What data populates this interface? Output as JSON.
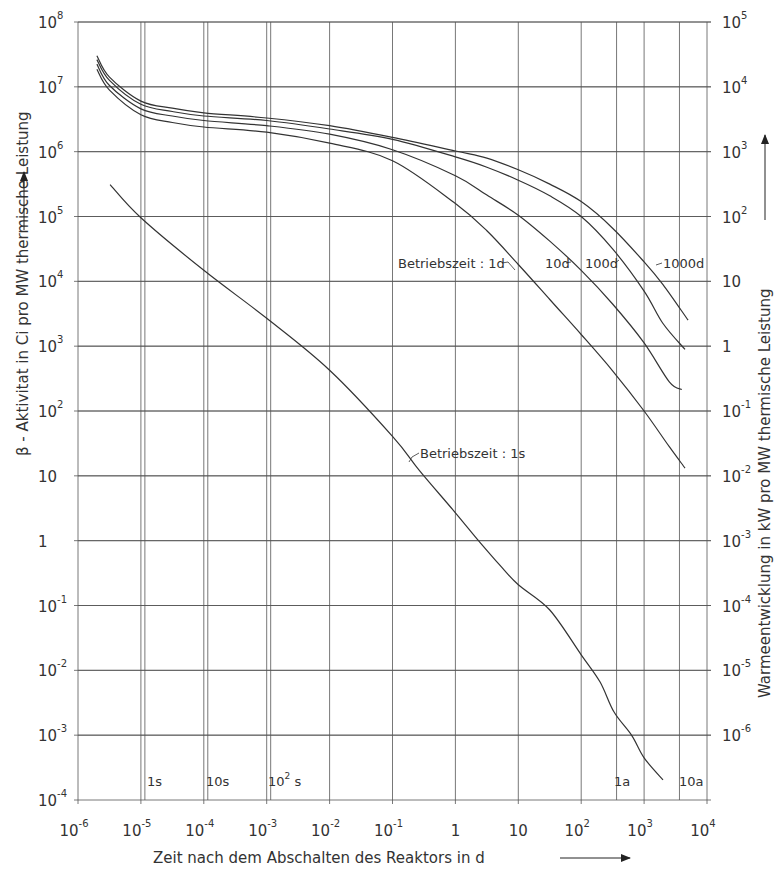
{
  "chart_data": {
    "type": "line",
    "title": "",
    "xlabel": "Zeit nach dem Abschalten des Reaktors in d",
    "ylabel": "β - Aktivitat in Ci pro MW thermische Leistung",
    "y2label": "Warmeentwicklung in kW pro MW thermische Leistung",
    "xscale": "log",
    "yscale": "log",
    "xlim": [
      1e-06,
      10000.0
    ],
    "ylim": [
      0.0001,
      100000000.0
    ],
    "y2lim": [
      1e-07,
      100000.0
    ],
    "grid": true,
    "x_tick_labels": [
      "10^-6",
      "10^-5",
      "10^-4",
      "10^-3",
      "10^-2",
      "10^-1",
      "1",
      "10",
      "10^2",
      "10^3",
      "10^4"
    ],
    "y_tick_labels": [
      "10^-4",
      "10^-3",
      "10^-2",
      "10^-1",
      "1",
      "10",
      "10^2",
      "10^3",
      "10^4",
      "10^5",
      "10^6",
      "10^7",
      "10^8"
    ],
    "y2_tick_labels": [
      "10^-6",
      "10^-5",
      "10^-4",
      "10^-3",
      "10^-2",
      "10^-1",
      "1",
      "10",
      "10^2",
      "10^3",
      "10^4",
      "10^5"
    ],
    "time_markers": [
      {
        "label": "1s",
        "t_days": 1.157e-05
      },
      {
        "label": "10s",
        "t_days": 0.0001157
      },
      {
        "label": "10^2 s",
        "t_days": 0.001157
      },
      {
        "label": "1a",
        "t_days": 365
      },
      {
        "label": "10a",
        "t_days": 3650
      }
    ],
    "series": [
      {
        "name": "Betriebszeit: 1s",
        "log_x": [
          -5.49,
          -5.0,
          -4.0,
          -3.0,
          -2.0,
          -1.0,
          -0.57,
          0.0,
          0.35,
          0.7,
          1.0,
          1.5,
          2.0,
          2.3,
          2.52,
          2.8,
          3.0,
          3.3
        ],
        "log_y": [
          5.49,
          4.98,
          4.17,
          3.43,
          2.63,
          1.61,
          1.08,
          0.43,
          0.02,
          -0.37,
          -0.68,
          -1.07,
          -1.76,
          -2.18,
          -2.64,
          -3.0,
          -3.35,
          -3.69
        ]
      },
      {
        "name": "Betriebszeit: 1d",
        "log_x": [
          -5.7,
          -5.5,
          -5.0,
          -4.5,
          -4.0,
          -3.0,
          -2.0,
          -1.0,
          0.0,
          0.5,
          1.0,
          1.5,
          2.0,
          2.5,
          3.0,
          3.4,
          3.65
        ],
        "log_y": [
          7.27,
          6.95,
          6.57,
          6.45,
          6.38,
          6.3,
          6.13,
          5.86,
          5.2,
          4.78,
          4.26,
          3.72,
          3.18,
          2.62,
          2.0,
          1.45,
          1.12
        ]
      },
      {
        "name": "Betriebszeit: 10d",
        "log_x": [
          -5.7,
          -5.5,
          -5.0,
          -4.5,
          -4.0,
          -3.0,
          -2.0,
          -1.0,
          0.0,
          0.5,
          1.0,
          1.5,
          2.0,
          2.5,
          3.0,
          3.4,
          3.6
        ],
        "log_y": [
          7.35,
          7.02,
          6.66,
          6.55,
          6.48,
          6.4,
          6.27,
          6.03,
          5.63,
          5.33,
          5.02,
          4.62,
          4.17,
          3.65,
          3.05,
          2.45,
          2.33
        ]
      },
      {
        "name": "Betriebszeit: 100d",
        "log_x": [
          -5.7,
          -5.5,
          -5.0,
          -4.5,
          -4.0,
          -3.0,
          -2.0,
          -1.0,
          0.0,
          0.5,
          1.0,
          1.5,
          2.0,
          2.5,
          3.0,
          3.3,
          3.65
        ],
        "log_y": [
          7.42,
          7.1,
          6.73,
          6.62,
          6.55,
          6.48,
          6.35,
          6.19,
          5.92,
          5.76,
          5.56,
          5.32,
          5.0,
          4.5,
          3.85,
          3.35,
          2.95
        ]
      },
      {
        "name": "Betriebszeit: 1000d",
        "log_x": [
          -5.7,
          -5.5,
          -5.0,
          -4.5,
          -4.0,
          -3.0,
          -2.0,
          -1.0,
          0.0,
          0.5,
          1.0,
          1.5,
          2.0,
          2.5,
          3.0,
          3.3,
          3.7
        ],
        "log_y": [
          7.48,
          7.15,
          6.78,
          6.67,
          6.6,
          6.52,
          6.4,
          6.22,
          6.01,
          5.9,
          5.72,
          5.5,
          5.23,
          4.82,
          4.3,
          3.95,
          3.4
        ]
      }
    ],
    "annotations": [
      {
        "text": "Betriebszeit : 1d",
        "near_series": "Betriebszeit: 1d"
      },
      {
        "text": "10d",
        "near_series": "Betriebszeit: 10d"
      },
      {
        "text": "100d",
        "near_series": "Betriebszeit: 100d"
      },
      {
        "text": "1000d",
        "near_series": "Betriebszeit: 1000d"
      },
      {
        "text": "Betriebszeit : 1s",
        "near_series": "Betriebszeit: 1s"
      }
    ]
  },
  "labels": {
    "xlabel": "Zeit nach dem Abschalten des Reaktors in d",
    "ylabel": "β - Aktivitat in Ci pro MW thermische Leistung",
    "y2label": "Warmeentwicklung in kW pro MW thermische Leistung",
    "anno_1d": "Betriebszeit : 1d",
    "anno_10d": "10d",
    "anno_100d": "100d",
    "anno_1000d": "1000d",
    "anno_1s": "Betriebszeit : 1s",
    "marker_1s": "1s",
    "marker_10s": "10s",
    "marker_100s_base": "10",
    "marker_100s_exp": "2",
    "marker_100s_unit": " s",
    "marker_1a": "1a",
    "marker_10a": "10a"
  },
  "x_ticks": [
    {
      "base": "10",
      "exp": "-6"
    },
    {
      "base": "10",
      "exp": "-5"
    },
    {
      "base": "10",
      "exp": "-4"
    },
    {
      "base": "10",
      "exp": "-3"
    },
    {
      "base": "10",
      "exp": "-2"
    },
    {
      "base": "10",
      "exp": "-1"
    },
    {
      "base": "1",
      "exp": ""
    },
    {
      "base": "10",
      "exp": ""
    },
    {
      "base": "10",
      "exp": "2"
    },
    {
      "base": "10",
      "exp": "3"
    },
    {
      "base": "10",
      "exp": "4"
    }
  ],
  "y_ticks": [
    {
      "base": "10",
      "exp": "8"
    },
    {
      "base": "10",
      "exp": "7"
    },
    {
      "base": "10",
      "exp": "6"
    },
    {
      "base": "10",
      "exp": "5"
    },
    {
      "base": "10",
      "exp": "4"
    },
    {
      "base": "10",
      "exp": "3"
    },
    {
      "base": "10",
      "exp": "2"
    },
    {
      "base": "10",
      "exp": ""
    },
    {
      "base": "1",
      "exp": ""
    },
    {
      "base": "10",
      "exp": "-1"
    },
    {
      "base": "10",
      "exp": "-2"
    },
    {
      "base": "10",
      "exp": "-3"
    },
    {
      "base": "10",
      "exp": "-4"
    }
  ],
  "y2_ticks": [
    {
      "base": "10",
      "exp": "5"
    },
    {
      "base": "10",
      "exp": "4"
    },
    {
      "base": "10",
      "exp": "3"
    },
    {
      "base": "10",
      "exp": "2"
    },
    {
      "base": "10",
      "exp": ""
    },
    {
      "base": "1",
      "exp": ""
    },
    {
      "base": "10",
      "exp": "-1"
    },
    {
      "base": "10",
      "exp": "-2"
    },
    {
      "base": "10",
      "exp": "-3"
    },
    {
      "base": "10",
      "exp": "-4"
    },
    {
      "base": "10",
      "exp": "-5"
    },
    {
      "base": "10",
      "exp": "-6"
    }
  ]
}
